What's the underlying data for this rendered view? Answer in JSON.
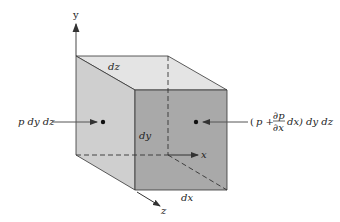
{
  "diagram": {
    "axes": {
      "x": "x",
      "y": "y",
      "z": "z"
    },
    "dimensions": {
      "dx": "dx",
      "dy": "dy",
      "dz": "dz"
    },
    "forces": {
      "left": "p dy dz",
      "right_open": "(",
      "right_p": "p +",
      "right_num": "∂p",
      "right_den": "∂x",
      "right_tail": "dx) dy dz"
    },
    "colors": {
      "top_face": "#e4e4e4",
      "left_face": "#cfcfcf",
      "front_face": "#a9a9a9",
      "edge": "#333333"
    }
  }
}
